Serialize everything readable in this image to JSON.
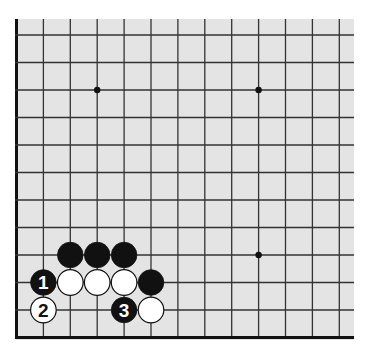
{
  "diagram": {
    "type": "go-board-fragment",
    "board_color": "#e4e4e4",
    "line_color": "#333333",
    "visible_columns": 13,
    "visible_rows": 12,
    "edges": [
      "left",
      "bottom"
    ],
    "star_points": [
      {
        "col": 3,
        "row": 9
      },
      {
        "col": 9,
        "row": 9
      },
      {
        "col": 9,
        "row": 3
      }
    ],
    "stones": [
      {
        "color": "black",
        "col": 2,
        "row": 3,
        "label": ""
      },
      {
        "color": "black",
        "col": 3,
        "row": 3,
        "label": ""
      },
      {
        "color": "black",
        "col": 4,
        "row": 3,
        "label": ""
      },
      {
        "color": "black",
        "col": 1,
        "row": 2,
        "label": "1"
      },
      {
        "color": "white",
        "col": 2,
        "row": 2,
        "label": ""
      },
      {
        "color": "white",
        "col": 3,
        "row": 2,
        "label": ""
      },
      {
        "color": "white",
        "col": 4,
        "row": 2,
        "label": ""
      },
      {
        "color": "black",
        "col": 5,
        "row": 2,
        "label": ""
      },
      {
        "color": "white",
        "col": 1,
        "row": 1,
        "label": "2"
      },
      {
        "color": "black",
        "col": 4,
        "row": 1,
        "label": "3"
      },
      {
        "color": "white",
        "col": 5,
        "row": 1,
        "label": ""
      }
    ]
  }
}
